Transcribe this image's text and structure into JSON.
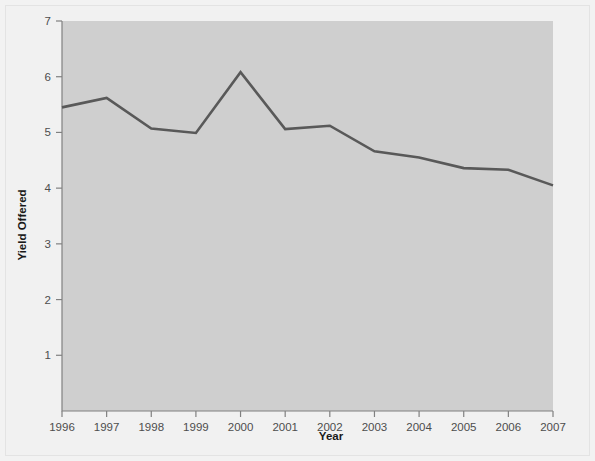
{
  "figure": {
    "background_color": "#f1f1f1",
    "plot_area_color": "#cfcfcf",
    "line_color": "#595959",
    "axis_color": "#808080",
    "tick_text_color": "#4d4d4d",
    "title_text_color": "#1a1a1a"
  },
  "chart_data": {
    "type": "line",
    "title": "",
    "xlabel": "Year",
    "ylabel": "Yield Offered",
    "categories": [
      "1996",
      "1997",
      "1998",
      "1999",
      "2000",
      "2001",
      "2002",
      "2003",
      "2004",
      "2005",
      "2006",
      "2007"
    ],
    "x": [
      1996,
      1997,
      1998,
      1999,
      2000,
      2001,
      2002,
      2003,
      2004,
      2005,
      2006,
      2007
    ],
    "values": [
      5.45,
      5.62,
      5.07,
      4.99,
      6.08,
      5.06,
      5.12,
      4.66,
      4.55,
      4.36,
      4.33,
      4.05
    ],
    "series": [
      {
        "name": "Yield Offered",
        "values": [
          5.45,
          5.62,
          5.07,
          4.99,
          6.08,
          5.06,
          5.12,
          4.66,
          4.55,
          4.36,
          4.33,
          4.05
        ]
      }
    ],
    "ylim": [
      0,
      7
    ],
    "xlim": [
      1996,
      2007
    ],
    "yticks": [
      1,
      2,
      3,
      4,
      5,
      6,
      7
    ],
    "ytick_labels": [
      "1",
      "2",
      "3",
      "4",
      "5",
      "6",
      "7"
    ],
    "xticks": [
      1996,
      1997,
      1998,
      1999,
      2000,
      2001,
      2002,
      2003,
      2004,
      2005,
      2006,
      2007
    ],
    "xtick_labels": [
      "1996",
      "1997",
      "1998",
      "1999",
      "2000",
      "2001",
      "2002",
      "2003",
      "2004",
      "2005",
      "2006",
      "2007"
    ],
    "grid": false,
    "legend": null,
    "legend_position": "none",
    "annotations": []
  }
}
